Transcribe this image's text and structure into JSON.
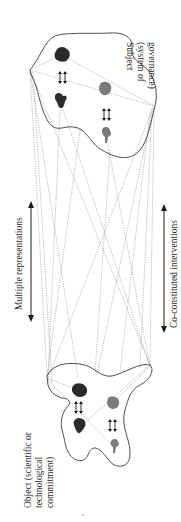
{
  "diagram": {
    "orientation": "rotated 90 degrees clockwise",
    "subject": {
      "line1": "Subject",
      "line2": "(system of",
      "line3": "governance)"
    },
    "object": {
      "line1": "Object (scientific or",
      "line2": "technological",
      "line3": "commitment)"
    },
    "left_arrow_label": "Multiple representations",
    "right_arrow_label": "Co-constituted interventions",
    "colors": {
      "outline": "#3a3a3a",
      "dark_shape": "#2b2b2b",
      "gray_shape": "#7a7a7a",
      "dotted_line": "#777777",
      "text": "#2a2a2a",
      "background": "#ffffff"
    }
  }
}
